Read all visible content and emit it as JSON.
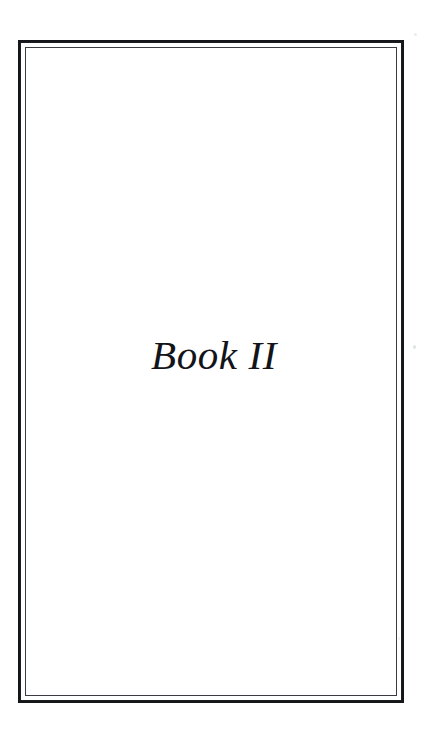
{
  "document": {
    "page_type": "part-title-page",
    "background_color": "#ffffff",
    "ink_color": "#131419"
  },
  "frame": {
    "style": "double-rule-border",
    "outer_rule_color": "#15161a",
    "inner_rule_color": "#3a3c42"
  },
  "title_block": {
    "title": "Book II"
  },
  "artifacts": {
    "speck_label": ""
  }
}
